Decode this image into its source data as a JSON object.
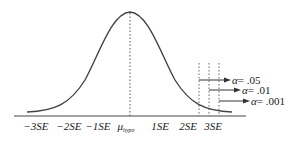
{
  "diagram": {
    "type": "normal-distribution",
    "axis_labels": [
      "−3SE",
      "−2SE",
      "−1SE",
      "μ",
      "1SE",
      "2SE",
      "3SE"
    ],
    "mean_symbol": "μ",
    "mean_subscript": "hypo",
    "alpha_labels": [
      {
        "symbol": "α",
        "text": "= .05"
      },
      {
        "symbol": "α",
        "text": "= .01"
      },
      {
        "symbol": "α",
        "text": "= .001"
      }
    ],
    "colors": {
      "line": "#333333",
      "text": "#222222"
    }
  }
}
